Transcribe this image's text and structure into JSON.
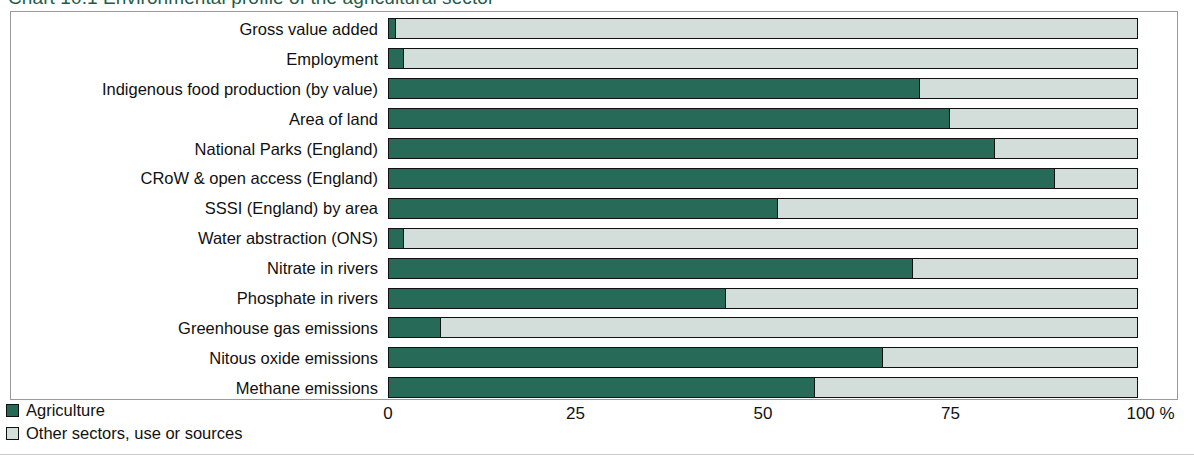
{
  "chart_title": "Chart 10.1 Environmental profile of the agricultural sector",
  "axis": {
    "unit_suffix": "%",
    "ticks": [
      "0",
      "25",
      "50",
      "75",
      "100"
    ],
    "tick_values": [
      0,
      25,
      50,
      75,
      100
    ]
  },
  "legend": {
    "items": [
      {
        "label": "Agriculture",
        "color": "#276a57",
        "swatch": "green"
      },
      {
        "label": "Other sectors, use or sources",
        "color": "#d3dedb",
        "swatch": "grey"
      }
    ]
  },
  "chart_data": {
    "type": "bar",
    "orientation": "horizontal",
    "stacked": true,
    "title": "Chart 10.1 Environmental profile of the agricultural sector",
    "xlabel": "%",
    "ylabel": "",
    "xlim": [
      0,
      100
    ],
    "grid": false,
    "legend_position": "bottom-left",
    "categories": [
      "Gross value added",
      "Employment",
      "Indigenous food production (by value)",
      "Area of land",
      "National Parks (England)",
      "CRoW & open access (England)",
      "SSSI (England) by area",
      "Water abstraction (ONS)",
      "Nitrate in rivers",
      "Phosphate in rivers",
      "Greenhouse gas emissions",
      "Nitous oxide emissions",
      "Methane emissions"
    ],
    "series": [
      {
        "name": "Agriculture",
        "color": "#276a57",
        "values": [
          1,
          2,
          71,
          75,
          81,
          89,
          52,
          2,
          70,
          45,
          7,
          66,
          57
        ]
      },
      {
        "name": "Other sectors, use or sources",
        "color": "#d3dedb",
        "values": [
          99,
          98,
          29,
          25,
          19,
          11,
          48,
          98,
          30,
          55,
          93,
          34,
          43
        ]
      }
    ]
  }
}
